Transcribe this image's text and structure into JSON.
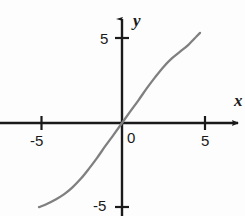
{
  "figure": {
    "background_color": "#fdfdfd",
    "axis_color": "#1a1a1a",
    "curve_color": "#808080"
  },
  "labels": {
    "x_axis": "x",
    "y_axis": "y",
    "origin": "0",
    "x_tick_neg5": "-5",
    "x_tick_pos5": "5",
    "y_tick_pos5": "5",
    "y_tick_neg5": "-5"
  },
  "chart_data": {
    "type": "line",
    "title": "",
    "xlabel": "x",
    "ylabel": "y",
    "grid": false,
    "legend": "none",
    "axis_style": "arrowed-cartesian-axes",
    "xlim": [
      -7.3,
      7.3
    ],
    "ylim": [
      -6.5,
      6.5
    ],
    "xticks": [
      -5,
      0,
      5
    ],
    "xticklabels": [
      "-5",
      "0",
      "5"
    ],
    "yticks": [
      -5,
      5
    ],
    "yticklabels": [
      "-5",
      "5"
    ],
    "series": [
      {
        "name": "curve",
        "description": "increasing S-shaped (sigmoid / odd) curve through the origin",
        "color": "#808080",
        "x": [
          -5.0,
          -4.5,
          -4.0,
          -3.5,
          -3.0,
          -2.5,
          -2.0,
          -1.5,
          -1.0,
          -0.5,
          0.0,
          0.5,
          1.0,
          1.5,
          2.0,
          2.5,
          3.0,
          3.5,
          4.0,
          4.5,
          4.7
        ],
        "y": [
          -4.95,
          -4.75,
          -4.5,
          -4.2,
          -3.8,
          -3.3,
          -2.7,
          -2.05,
          -1.35,
          -0.68,
          0.0,
          0.68,
          1.35,
          2.05,
          2.7,
          3.3,
          3.8,
          4.2,
          4.6,
          5.1,
          5.3
        ]
      }
    ]
  }
}
